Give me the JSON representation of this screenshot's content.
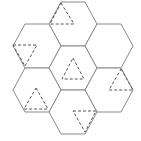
{
  "diagram": {
    "colors": {
      "background": "#ffffff",
      "hex_stroke": "#8a8a8a",
      "triangle_stroke": "#555555"
    },
    "hexagons": [
      {
        "id": "top",
        "points": "61,2 85,2 97,24 85,46 61,46 49,24"
      },
      {
        "id": "upper-left",
        "points": "25,24 49,24 61,46 49,68 25,68 13,46"
      },
      {
        "id": "upper-right",
        "points": "97,24 121,24 133,46 121,68 97,68 85,46"
      },
      {
        "id": "center",
        "points": "61,46 85,46 97,68 85,90 61,90 49,68"
      },
      {
        "id": "lower-left",
        "points": "25,68 49,68 61,90 49,112 25,112 13,90"
      },
      {
        "id": "lower-right",
        "points": "97,68 121,68 133,90 121,112 97,112 85,90"
      },
      {
        "id": "bottom",
        "points": "61,90 85,90 97,112 85,134 61,134 49,112"
      }
    ],
    "triangles": [
      {
        "id": "top-tri",
        "points": "61,3 74,24 50,24"
      },
      {
        "id": "upper-left-tri",
        "points": "13,45 37,45 25,66"
      },
      {
        "id": "center-tri",
        "points": "73,58 84,79 62,79"
      },
      {
        "id": "lower-left-tri",
        "points": "36,88 48,109 24,109"
      },
      {
        "id": "lower-right-tri",
        "points": "121,69 133,90 109,90"
      },
      {
        "id": "bottom-tri",
        "points": "73,111 96,111 85,132"
      }
    ]
  }
}
